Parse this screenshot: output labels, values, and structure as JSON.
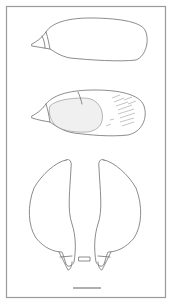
{
  "figure": {
    "type": "scientific line illustration",
    "panels": [
      {
        "name": "specimen-lateral-view",
        "description": "elongated oval outline with pointed left tip"
      },
      {
        "name": "specimen-detailed-view",
        "description": "oval outline with stippled inner region and hatching on right"
      },
      {
        "name": "specimen-paired-valves",
        "description": "two mirrored elongated lobes with tapered bases and small central rectangle"
      }
    ],
    "scale_bar": {
      "label": ""
    },
    "colors": {
      "line": "#6e6e6e",
      "frame": "#9a9a9a",
      "background": "#ffffff"
    }
  }
}
